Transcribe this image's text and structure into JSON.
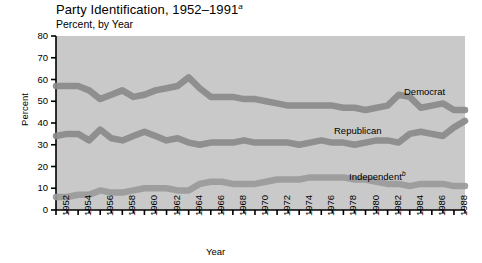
{
  "chart_data": {
    "type": "line",
    "title": "Party Identification, 1952–1991",
    "title_superscript": "a",
    "subtitle": "Percent, by Year",
    "xlabel": "Year",
    "ylabel": "Percent",
    "ylim": [
      0,
      80
    ],
    "yticks": [
      0,
      10,
      20,
      30,
      40,
      50,
      60,
      70,
      80
    ],
    "ytick_labels": [
      "0",
      "10",
      "20",
      "30",
      "40",
      "50",
      "60",
      "70",
      "80"
    ],
    "xlim": [
      1952,
      1989
    ],
    "xtick_labels": [
      "1952",
      "1954",
      "1956",
      "1958",
      "1960",
      "1962",
      "1964",
      "1966",
      "1968",
      "1970",
      "1972",
      "1974",
      "1976",
      "1978",
      "1980",
      "1982",
      "1984",
      "1986",
      "1988"
    ],
    "x": [
      1952,
      1953,
      1954,
      1955,
      1956,
      1957,
      1958,
      1959,
      1960,
      1961,
      1962,
      1963,
      1964,
      1965,
      1966,
      1967,
      1968,
      1969,
      1970,
      1971,
      1972,
      1973,
      1974,
      1975,
      1976,
      1977,
      1978,
      1979,
      1980,
      1981,
      1982,
      1983,
      1984,
      1985,
      1986,
      1987,
      1988,
      1989
    ],
    "grid": false,
    "legend_position": "inline-annotations",
    "series": [
      {
        "name": "Democrat",
        "color": "#8a8a8a",
        "label_position": {
          "x": 404,
          "y": 86
        },
        "values": [
          57,
          57,
          57,
          55,
          51,
          53,
          55,
          52,
          53,
          55,
          56,
          57,
          61,
          56,
          52,
          52,
          52,
          51,
          51,
          50,
          49,
          48,
          48,
          48,
          48,
          48,
          47,
          47,
          46,
          47,
          48,
          53,
          52,
          47,
          48,
          49,
          46,
          46
        ]
      },
      {
        "name": "Republican",
        "color": "#8a8a8a",
        "label_position": {
          "x": 334,
          "y": 125
        },
        "values": [
          34,
          35,
          35,
          32,
          37,
          33,
          32,
          34,
          36,
          34,
          32,
          33,
          31,
          30,
          31,
          31,
          31,
          32,
          31,
          31,
          31,
          31,
          30,
          31,
          32,
          31,
          31,
          30,
          31,
          32,
          32,
          31,
          35,
          36,
          35,
          34,
          38,
          41
        ]
      },
      {
        "name": "Independent",
        "name_superscript": "b",
        "color": "#9a9a9a",
        "label_position": {
          "x": 349,
          "y": 170
        },
        "values": [
          6,
          6,
          7,
          7,
          9,
          8,
          8,
          9,
          10,
          10,
          10,
          9,
          9,
          12,
          13,
          13,
          12,
          12,
          12,
          13,
          14,
          14,
          14,
          15,
          15,
          15,
          15,
          14,
          14,
          13,
          12,
          12,
          11,
          12,
          12,
          12,
          11,
          11
        ]
      }
    ]
  },
  "axes": {
    "ytick_labels": [
      "80",
      "70",
      "60",
      "50",
      "40",
      "30",
      "20",
      "10",
      "0"
    ],
    "xtick_labels": [
      "1952",
      "1954",
      "1956",
      "1958",
      "1960",
      "1962",
      "1964",
      "1966",
      "1968",
      "1970",
      "1972",
      "1974",
      "1976",
      "1978",
      "1980",
      "1982",
      "1984",
      "1986",
      "1988"
    ]
  }
}
